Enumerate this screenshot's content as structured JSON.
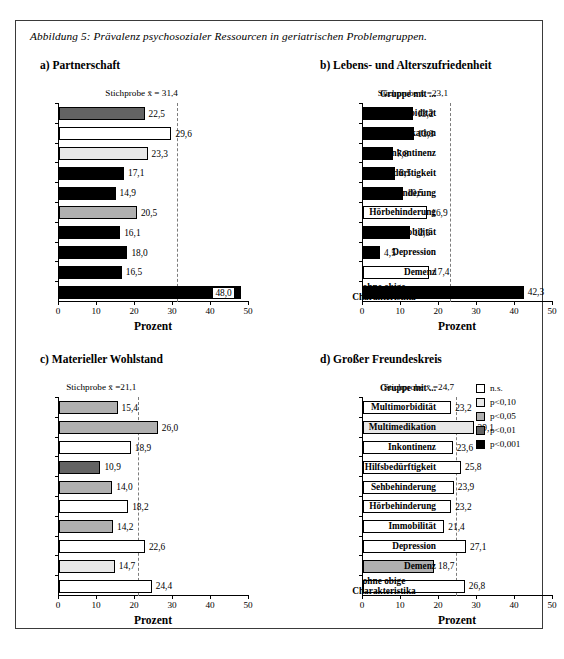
{
  "figure": {
    "caption": "Abbildung 5: Prävalenz psychosozialer Ressourcen in geriatrischen Problemgruppen."
  },
  "axis": {
    "xlabel": "Prozent",
    "ticks": [
      "0",
      "10",
      "20",
      "30",
      "40",
      "50"
    ],
    "xlim": [
      0,
      50
    ]
  },
  "categories_header": "Gruppe mit ...",
  "categories": [
    "Multimorbidität",
    "Multimedikation",
    "Inkontinenz",
    "Hilfsbedürftigkeit",
    "Sehbehinderung",
    "Hörbehinderung",
    "Immobilität",
    "Depression",
    "Demenz",
    "ohne obige Charakteristika"
  ],
  "legend": {
    "items": [
      {
        "label": "n.s.",
        "color": "#ffffff"
      },
      {
        "label": "p<0,10",
        "color": "#e8e8e8"
      },
      {
        "label": "p<0,05",
        "color": "#b0b0b0"
      },
      {
        "label": "p<0,01",
        "color": "#636363"
      },
      {
        "label": "p<0,001",
        "color": "#000000"
      }
    ]
  },
  "chart_data": [
    {
      "id": "a",
      "type": "bar",
      "title": "a)  Partnerschaft",
      "xlabel": "Prozent",
      "ylabel": "",
      "xlim": [
        0,
        50
      ],
      "grid": false,
      "orientation": "horizontal",
      "mean_label": "Stichprobe x̄ = 31,4",
      "mean_value": 31.4,
      "categories": [
        "Multimorbidität",
        "Multimedikation",
        "Inkontinenz",
        "Hilfsbedürftigkeit",
        "Sehbehinderung",
        "Hörbehinderung",
        "Immobilität",
        "Depression",
        "Demenz",
        "ohne obige Charakteristika"
      ],
      "values": [
        22.5,
        29.6,
        23.3,
        17.1,
        14.9,
        20.5,
        16.1,
        18.0,
        16.5,
        48.0
      ],
      "value_labels": [
        "22,5",
        "29,6",
        "23,3",
        "17,1",
        "14,9",
        "20,5",
        "16,1",
        "18,0",
        "16,5",
        "48,0"
      ],
      "significance": [
        "p<0,01",
        "n.s.",
        "p<0,10",
        "p<0,001",
        "p<0,001",
        "p<0,05",
        "p<0,001",
        "p<0,001",
        "p<0,001",
        "p<0,001"
      ],
      "colors": [
        "#636363",
        "#ffffff",
        "#e8e8e8",
        "#000000",
        "#000000",
        "#b0b0b0",
        "#000000",
        "#000000",
        "#000000",
        "#000000"
      ],
      "label_inside": [
        false,
        false,
        false,
        false,
        false,
        false,
        false,
        false,
        false,
        true
      ]
    },
    {
      "id": "b",
      "type": "bar",
      "title": "b)  Lebens- und Alterszufriedenheit",
      "xlabel": "Prozent",
      "ylabel": "",
      "xlim": [
        0,
        50
      ],
      "grid": false,
      "orientation": "horizontal",
      "mean_label": "Stichprobe x̄ =23,1",
      "mean_value": 23.1,
      "categories": [
        "Multimorbidität",
        "Multimedikation",
        "Inkontinenz",
        "Hilfsbedürftigkeit",
        "Sehbehinderung",
        "Hörbehinderung",
        "Immobilität",
        "Depression",
        "Demenz",
        "ohne obige Charakteristika"
      ],
      "values": [
        13.2,
        13.3,
        7.8,
        8.5,
        10.5,
        16.9,
        12.3,
        4.5,
        17.4,
        42.3
      ],
      "value_labels": [
        "13,2",
        "13,3",
        "7,8",
        "8,5",
        "10,5",
        "16,9",
        "12,3",
        "4,5",
        "17,4",
        "42,3"
      ],
      "significance": [
        "p<0,001",
        "p<0,001",
        "p<0,001",
        "p<0,001",
        "p<0,001",
        "n.s.",
        "p<0,001",
        "p<0,001",
        "n.s.",
        "p<0,001"
      ],
      "colors": [
        "#000000",
        "#000000",
        "#000000",
        "#000000",
        "#000000",
        "#ffffff",
        "#000000",
        "#000000",
        "#ffffff",
        "#000000"
      ],
      "label_inside": [
        false,
        false,
        false,
        false,
        false,
        false,
        false,
        false,
        false,
        false
      ]
    },
    {
      "id": "c",
      "type": "bar",
      "title": "c) Materieller Wohlstand",
      "xlabel": "Prozent",
      "ylabel": "",
      "xlim": [
        0,
        50
      ],
      "grid": false,
      "orientation": "horizontal",
      "mean_label": "Stichprobe x̄ =21,1",
      "mean_value": 21.1,
      "categories": [
        "Multimorbidität",
        "Multimedikation",
        "Inkontinenz",
        "Hilfsbedürftigkeit",
        "Sehbehinderung",
        "Hörbehinderung",
        "Immobilität",
        "Depression",
        "Demenz",
        "ohne obige Charakteristika"
      ],
      "values": [
        15.4,
        26.0,
        18.9,
        10.9,
        14.0,
        18.2,
        14.2,
        22.6,
        14.7,
        24.4
      ],
      "value_labels": [
        "15,4",
        "26,0",
        "18,9",
        "10,9",
        "14,0",
        "18,2",
        "14,2",
        "22,6",
        "14,7",
        "24,4"
      ],
      "significance": [
        "p<0,05",
        "p<0,05",
        "n.s.",
        "p<0,01",
        "p<0,05",
        "n.s.",
        "p<0,05",
        "n.s.",
        "p<0,10",
        "n.s."
      ],
      "colors": [
        "#b0b0b0",
        "#b0b0b0",
        "#ffffff",
        "#636363",
        "#b0b0b0",
        "#ffffff",
        "#b0b0b0",
        "#ffffff",
        "#e8e8e8",
        "#ffffff"
      ],
      "label_inside": [
        false,
        false,
        false,
        false,
        false,
        false,
        false,
        false,
        false,
        false
      ]
    },
    {
      "id": "d",
      "type": "bar",
      "title": "d)  Großer Freundeskreis",
      "xlabel": "Prozent",
      "ylabel": "",
      "xlim": [
        0,
        50
      ],
      "grid": false,
      "orientation": "horizontal",
      "mean_label": "Stichprobe x̄ =24,7",
      "mean_value": 24.7,
      "categories": [
        "Multimorbidität",
        "Multimedikation",
        "Inkontinenz",
        "Hilfsbedürftigkeit",
        "Sehbehinderung",
        "Hörbehinderung",
        "Immobilität",
        "Depression",
        "Demenz",
        "ohne obige Charakteristika"
      ],
      "values": [
        23.2,
        29.1,
        23.6,
        25.8,
        23.9,
        23.2,
        21.4,
        27.1,
        18.7,
        26.8
      ],
      "value_labels": [
        "23,2",
        "29,1",
        "23,6",
        "25,8",
        "23,9",
        "23,2",
        "21,4",
        "27,1",
        "18,7",
        "26,8"
      ],
      "significance": [
        "n.s.",
        "p<0,10",
        "n.s.",
        "n.s.",
        "n.s.",
        "n.s.",
        "n.s.",
        "n.s.",
        "p<0,05",
        "n.s."
      ],
      "colors": [
        "#ffffff",
        "#e8e8e8",
        "#ffffff",
        "#ffffff",
        "#ffffff",
        "#ffffff",
        "#ffffff",
        "#ffffff",
        "#b0b0b0",
        "#ffffff"
      ],
      "label_inside": [
        false,
        false,
        false,
        false,
        false,
        false,
        false,
        false,
        false,
        false
      ]
    }
  ]
}
